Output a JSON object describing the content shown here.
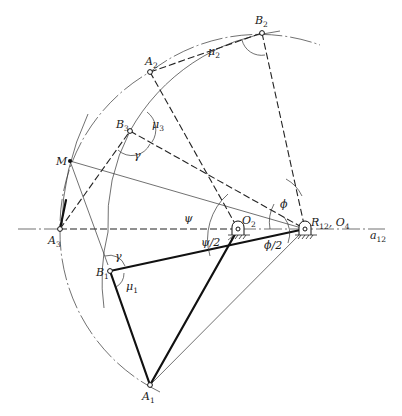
{
  "figure": {
    "type": "four-bar linkage synthesis diagram",
    "points": {
      "A1": {
        "label": "A",
        "sub": "1",
        "x": 150,
        "y": 385
      },
      "A2": {
        "label": "A",
        "sub": "2",
        "x": 150,
        "y": 72
      },
      "A3": {
        "label": "A",
        "sub": "3",
        "x": 60,
        "y": 229
      },
      "B1": {
        "label": "B",
        "sub": "1",
        "x": 110,
        "y": 271
      },
      "B2": {
        "label": "B",
        "sub": "2",
        "x": 262,
        "y": 33
      },
      "B3": {
        "label": "B",
        "sub": "3",
        "x": 130,
        "y": 131
      },
      "M": {
        "label": "M",
        "x": 70,
        "y": 161
      },
      "O2": {
        "label": "O",
        "sub": "2",
        "x": 238,
        "y": 229
      },
      "R12_O4": {
        "label": "R",
        "sub": "12",
        "suffix": ", O",
        "suffix_sub": "4",
        "x": 305,
        "y": 229
      }
    },
    "angles": {
      "mu1": {
        "label": "μ",
        "sub": "1"
      },
      "mu2": {
        "label": "μ",
        "sub": "2"
      },
      "mu3": {
        "label": "μ",
        "sub": "3"
      },
      "gamma_top": {
        "label": "γ"
      },
      "gamma_bottom": {
        "label": "γ"
      },
      "psi": {
        "label": "ψ"
      },
      "psi_half": {
        "label": "ψ/2"
      },
      "phi": {
        "label": "ϕ"
      },
      "phi_half": {
        "label": "ϕ/2"
      }
    },
    "axis": {
      "label": "a",
      "sub": "12"
    }
  }
}
